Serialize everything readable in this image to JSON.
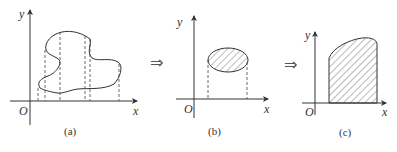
{
  "figure": {
    "panels": [
      {
        "id": "a",
        "caption": "(a)",
        "x_label": "x",
        "y_label": "y",
        "origin_label": "O"
      },
      {
        "id": "b",
        "caption": "(b)",
        "x_label": "x",
        "y_label": "y",
        "origin_label": "O"
      },
      {
        "id": "c",
        "caption": "(c)",
        "x_label": "x",
        "y_label": "y",
        "origin_label": "O"
      }
    ],
    "arrows": [
      "⇒",
      "⇒"
    ],
    "colors": {
      "stroke": "#333333",
      "hatch": "#555555",
      "background": "#ffffff"
    }
  }
}
